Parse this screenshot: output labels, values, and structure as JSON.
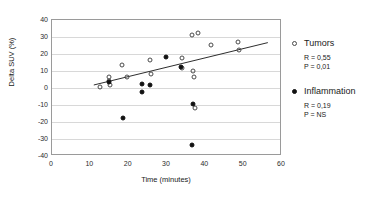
{
  "chart_data": {
    "type": "scatter",
    "title": "",
    "xlabel": "Time (minutes)",
    "ylabel": "Delta SUV (%)",
    "xlim": [
      0,
      60
    ],
    "ylim": [
      -40,
      40
    ],
    "xticks": [
      0,
      10,
      20,
      30,
      40,
      50,
      60
    ],
    "yticks": [
      40,
      30,
      20,
      10,
      0,
      -10,
      -20,
      -30,
      -40
    ],
    "grid": "horizontal",
    "legend_position": "right",
    "series": [
      {
        "name": "Tumors",
        "marker": "open-circle",
        "color": "#4a4a4a",
        "R": "0,55",
        "P": "0,01",
        "points": [
          {
            "x": 12.6,
            "y": 0.5
          },
          {
            "x": 14.8,
            "y": 6.5
          },
          {
            "x": 14.9,
            "y": 4.2
          },
          {
            "x": 15.0,
            "y": 2.0
          },
          {
            "x": 18.3,
            "y": 13.5
          },
          {
            "x": 19.6,
            "y": 6.2
          },
          {
            "x": 25.5,
            "y": 16.6
          },
          {
            "x": 25.7,
            "y": 8.0
          },
          {
            "x": 33.9,
            "y": 17.8
          },
          {
            "x": 34.0,
            "y": 11.6
          },
          {
            "x": 36.6,
            "y": 31.0
          },
          {
            "x": 36.8,
            "y": 10.0
          },
          {
            "x": 37.0,
            "y": 6.2
          },
          {
            "x": 37.2,
            "y": -11.5
          },
          {
            "x": 38.2,
            "y": 32.3
          },
          {
            "x": 41.5,
            "y": 25.2
          },
          {
            "x": 48.5,
            "y": 26.8
          },
          {
            "x": 48.7,
            "y": 22.5
          }
        ]
      },
      {
        "name": "Inflammation",
        "marker": "filled-circle",
        "color": "#111111",
        "R": "0,19",
        "P": "NS",
        "points": [
          {
            "x": 14.9,
            "y": 3.5
          },
          {
            "x": 18.4,
            "y": -17.5
          },
          {
            "x": 23.5,
            "y": 2.2
          },
          {
            "x": 23.6,
            "y": -2.5
          },
          {
            "x": 25.6,
            "y": 1.7
          },
          {
            "x": 29.8,
            "y": 18.3
          },
          {
            "x": 33.7,
            "y": 12.2
          },
          {
            "x": 36.8,
            "y": -9.6
          },
          {
            "x": 36.5,
            "y": -33.4
          }
        ]
      }
    ],
    "regression_line": {
      "series": "Tumors",
      "x_start": 11.0,
      "y_start": 1.2,
      "x_end": 56.8,
      "y_end": 26.5
    }
  },
  "legend": {
    "tumors": {
      "label": "Tumors",
      "r_text": "R = 0,55",
      "p_text": "P = 0,01"
    },
    "inflammation": {
      "label": "Inflammation",
      "r_text": "R = 0,19",
      "p_text": "P = NS"
    }
  }
}
